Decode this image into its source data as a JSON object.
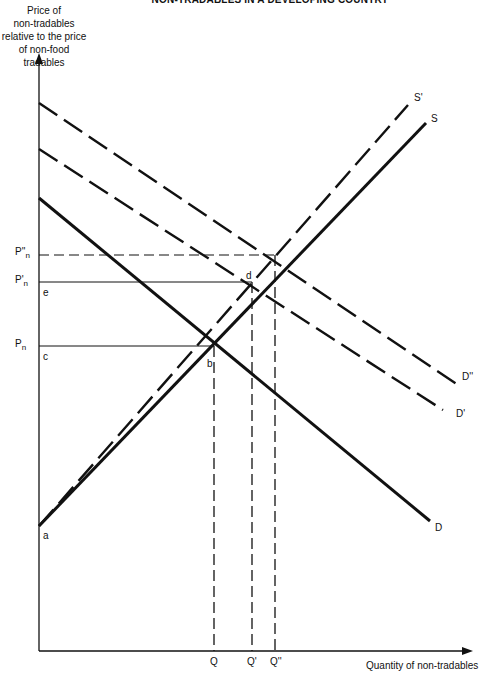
{
  "title": "NON-TRADABLES IN A DEVELOPING COUNTRY",
  "y_axis": {
    "label_lines": [
      "Price of",
      "non-tradables",
      "relative to the price",
      "of non-food tradables"
    ]
  },
  "x_axis": {
    "label": "Quantity of non-tradables"
  },
  "price_levels": [
    {
      "main": "P''",
      "sub": "n",
      "style": "dashed"
    },
    {
      "main": "P'",
      "sub": "n",
      "style": "solid"
    },
    {
      "main": "P",
      "sub": "n",
      "style": "solid"
    }
  ],
  "quantity_levels": [
    "Q",
    "Q'",
    "Q''"
  ],
  "curves": {
    "S": "S",
    "S_prime": "S'",
    "D": "D",
    "D_prime": "D'",
    "D_double_prime": "D''"
  },
  "points": {
    "a": "a",
    "b": "b",
    "c": "c",
    "d": "d",
    "e": "e"
  },
  "colors": {
    "line": "#111111",
    "background": "#ffffff"
  }
}
